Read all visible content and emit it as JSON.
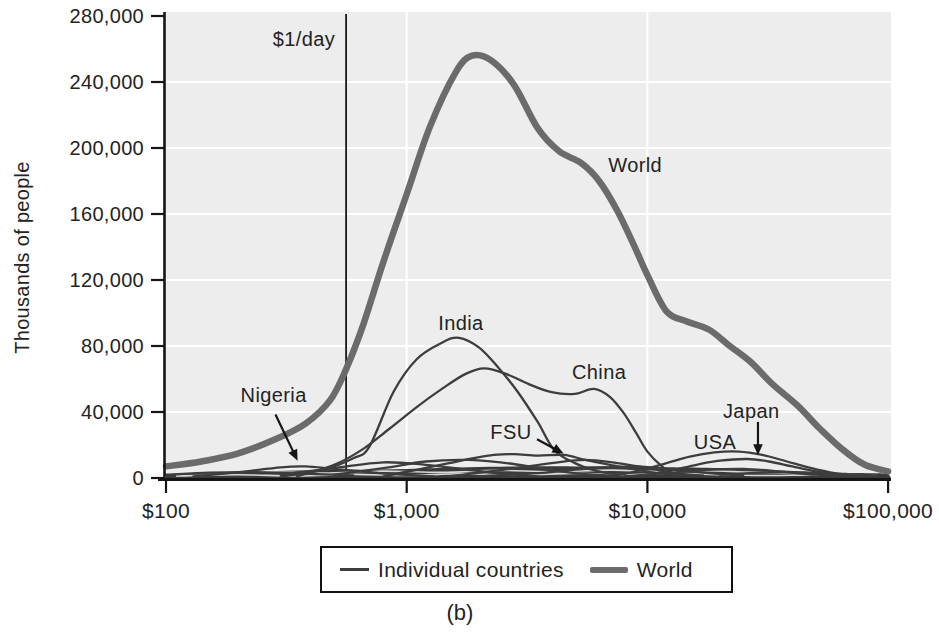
{
  "caption": "(b)",
  "legend": {
    "items": [
      {
        "swatch": "thin",
        "label": "Individual countries"
      },
      {
        "swatch": "thick",
        "label": "World"
      }
    ]
  },
  "chart_data": {
    "type": "line",
    "title": "",
    "xlabel": "",
    "ylabel": "Thousands of people",
    "x_scale": "log",
    "xlim": [
      100,
      100000
    ],
    "ylim": [
      0,
      280000
    ],
    "grid": true,
    "legend_position": "bottom-center",
    "colors": {
      "plot_bg": "#ededed",
      "grid": "#ffffff",
      "world": "#6b6b6b",
      "country": "#3d3d3d",
      "band": "#3a3a3a",
      "streak": "#d9d9d9",
      "axis": "#151515",
      "rule": "#1a1a1a",
      "legend_border": "#111111",
      "text": "#232323"
    },
    "yticks": [
      {
        "v": 0,
        "label": "0"
      },
      {
        "v": 40000,
        "label": "40,000"
      },
      {
        "v": 80000,
        "label": "80,000"
      },
      {
        "v": 120000,
        "label": "120,000"
      },
      {
        "v": 160000,
        "label": "160,000"
      },
      {
        "v": 200000,
        "label": "200,000"
      },
      {
        "v": 240000,
        "label": "240,000"
      },
      {
        "v": 280000,
        "label": "280,000"
      }
    ],
    "xticks": [
      {
        "d": 100,
        "label": "$100"
      },
      {
        "d": 1000,
        "label": "$1,000"
      },
      {
        "d": 10000,
        "label": "$10,000"
      },
      {
        "d": 100000,
        "label": "$100,000"
      }
    ],
    "rule": {
      "dollars": 560,
      "label": "$1/day"
    },
    "baseline_band": {
      "name": "many overlapping low-population countries",
      "points": [
        [
          100,
          2500
        ],
        [
          200,
          3500
        ],
        [
          350,
          4500
        ],
        [
          600,
          5000
        ],
        [
          1000,
          5500
        ],
        [
          1800,
          6500
        ],
        [
          3000,
          7000
        ],
        [
          5000,
          7000
        ],
        [
          8000,
          7000
        ],
        [
          12000,
          6500
        ],
        [
          20000,
          6000
        ],
        [
          30000,
          5000
        ],
        [
          45000,
          4000
        ],
        [
          65000,
          3200
        ],
        [
          100000,
          2800
        ]
      ]
    },
    "band_streaks": [
      {
        "points": [
          [
            110,
            1200
          ],
          [
            200,
            2000
          ],
          [
            350,
            1200
          ],
          [
            600,
            2200
          ],
          [
            1000,
            1500
          ],
          [
            1700,
            2600
          ],
          [
            3000,
            1800
          ],
          [
            5000,
            2800
          ],
          [
            8000,
            2000
          ],
          [
            13000,
            2800
          ],
          [
            20000,
            2000
          ],
          [
            32000,
            1500
          ],
          [
            50000,
            1800
          ],
          [
            80000,
            1200
          ]
        ]
      },
      {
        "points": [
          [
            130,
            3000
          ],
          [
            250,
            3800
          ],
          [
            450,
            3000
          ],
          [
            800,
            4200
          ],
          [
            1400,
            3400
          ],
          [
            2400,
            4600
          ],
          [
            4000,
            3800
          ],
          [
            7000,
            4800
          ],
          [
            11000,
            4000
          ],
          [
            17000,
            4400
          ],
          [
            26000,
            3600
          ],
          [
            40000,
            2800
          ],
          [
            60000,
            2200
          ],
          [
            90000,
            1800
          ]
        ]
      }
    ],
    "series": [
      {
        "name": "World",
        "role": "world",
        "points": [
          [
            100,
            7000
          ],
          [
            140,
            10000
          ],
          [
            200,
            15000
          ],
          [
            280,
            23000
          ],
          [
            380,
            33000
          ],
          [
            480,
            47000
          ],
          [
            560,
            66000
          ],
          [
            660,
            93000
          ],
          [
            800,
            131000
          ],
          [
            1000,
            172000
          ],
          [
            1250,
            213000
          ],
          [
            1600,
            246000
          ],
          [
            1870,
            256000
          ],
          [
            2250,
            253000
          ],
          [
            2800,
            238000
          ],
          [
            3500,
            212000
          ],
          [
            4300,
            198000
          ],
          [
            5300,
            191000
          ],
          [
            6300,
            180000
          ],
          [
            7500,
            162000
          ],
          [
            8800,
            141000
          ],
          [
            10000,
            123000
          ],
          [
            12000,
            101000
          ],
          [
            14500,
            95000
          ],
          [
            18000,
            90000
          ],
          [
            22000,
            80000
          ],
          [
            27000,
            70000
          ],
          [
            33000,
            57000
          ],
          [
            42000,
            44000
          ],
          [
            52000,
            30000
          ],
          [
            65000,
            17000
          ],
          [
            80000,
            8000
          ],
          [
            100000,
            4000
          ]
        ]
      },
      {
        "name": "India",
        "role": "country",
        "points": [
          [
            300,
            1000
          ],
          [
            450,
            5000
          ],
          [
            600,
            12000
          ],
          [
            700,
            19000
          ],
          [
            880,
            52000
          ],
          [
            1100,
            72000
          ],
          [
            1400,
            82000
          ],
          [
            1650,
            85000
          ],
          [
            2000,
            79000
          ],
          [
            2400,
            67000
          ],
          [
            2900,
            52000
          ],
          [
            3500,
            34000
          ],
          [
            4100,
            17000
          ],
          [
            5000,
            9000
          ],
          [
            6100,
            4500
          ],
          [
            7500,
            2000
          ]
        ]
      },
      {
        "name": "China",
        "role": "country",
        "points": [
          [
            350,
            1000
          ],
          [
            500,
            8000
          ],
          [
            650,
            17000
          ],
          [
            850,
            30000
          ],
          [
            1100,
            43000
          ],
          [
            1400,
            54000
          ],
          [
            1750,
            63000
          ],
          [
            2100,
            66500
          ],
          [
            2600,
            63000
          ],
          [
            3200,
            57000
          ],
          [
            4000,
            52000
          ],
          [
            5000,
            51000
          ],
          [
            6000,
            54000
          ],
          [
            7000,
            49000
          ],
          [
            8000,
            39000
          ],
          [
            9000,
            27000
          ],
          [
            10000,
            16000
          ],
          [
            11500,
            7000
          ],
          [
            13000,
            2000
          ]
        ]
      },
      {
        "name": "FSU",
        "role": "country",
        "points": [
          [
            800,
            1000
          ],
          [
            1100,
            5000
          ],
          [
            1500,
            9000
          ],
          [
            1900,
            12000
          ],
          [
            2300,
            14000
          ],
          [
            2800,
            14500
          ],
          [
            3500,
            13500
          ],
          [
            4500,
            14000
          ],
          [
            5500,
            11000
          ],
          [
            7000,
            8000
          ],
          [
            9000,
            5000
          ],
          [
            11000,
            3000
          ],
          [
            14000,
            1500
          ]
        ]
      },
      {
        "name": "USA",
        "role": "country",
        "points": [
          [
            7000,
            1000
          ],
          [
            9000,
            4000
          ],
          [
            12000,
            9000
          ],
          [
            15000,
            13000
          ],
          [
            19000,
            15500
          ],
          [
            24000,
            16000
          ],
          [
            30000,
            14000
          ],
          [
            38000,
            10000
          ],
          [
            48000,
            6000
          ],
          [
            60000,
            3000
          ],
          [
            75000,
            1500
          ],
          [
            90000,
            1000
          ]
        ]
      },
      {
        "name": "Japan",
        "role": "country",
        "points": [
          [
            9000,
            1000
          ],
          [
            12000,
            4000
          ],
          [
            16000,
            8000
          ],
          [
            20000,
            10500
          ],
          [
            26000,
            11500
          ],
          [
            32000,
            10000
          ],
          [
            40000,
            7000
          ],
          [
            50000,
            4000
          ],
          [
            62000,
            2000
          ],
          [
            75000,
            1000
          ]
        ]
      },
      {
        "name": "Nigeria",
        "role": "country",
        "points": [
          [
            130,
            1000
          ],
          [
            200,
            3500
          ],
          [
            300,
            6500
          ],
          [
            380,
            7000
          ],
          [
            500,
            5500
          ],
          [
            700,
            3500
          ],
          [
            950,
            2000
          ],
          [
            1300,
            1000
          ]
        ]
      },
      {
        "name": "unlabeled-1",
        "role": "country",
        "points": [
          [
            1500,
            1000
          ],
          [
            2500,
            5000
          ],
          [
            4000,
            9000
          ],
          [
            5500,
            11000
          ],
          [
            7500,
            9000
          ],
          [
            10000,
            6000
          ],
          [
            13000,
            3000
          ],
          [
            17000,
            1500
          ]
        ]
      },
      {
        "name": "unlabeled-2",
        "role": "country",
        "points": [
          [
            500,
            2000
          ],
          [
            800,
            6000
          ],
          [
            1200,
            10000
          ],
          [
            1800,
            11000
          ],
          [
            2600,
            9000
          ],
          [
            3600,
            6000
          ],
          [
            5000,
            3000
          ],
          [
            7000,
            1500
          ]
        ]
      },
      {
        "name": "unlabeled-3",
        "role": "country",
        "points": [
          [
            300,
            2000
          ],
          [
            500,
            6000
          ],
          [
            800,
            9500
          ],
          [
            1200,
            8000
          ],
          [
            1800,
            5000
          ],
          [
            2600,
            2500
          ],
          [
            3500,
            1000
          ]
        ]
      },
      {
        "name": "unlabeled-4",
        "role": "country",
        "points": [
          [
            2000,
            1000
          ],
          [
            3500,
            3000
          ],
          [
            6000,
            6000
          ],
          [
            9000,
            7000
          ],
          [
            13000,
            5000
          ],
          [
            18000,
            3000
          ],
          [
            25000,
            1500
          ]
        ]
      },
      {
        "name": "unlabeled-5",
        "role": "country",
        "points": [
          [
            8000,
            1000
          ],
          [
            12000,
            3000
          ],
          [
            18000,
            5000
          ],
          [
            25000,
            5500
          ],
          [
            35000,
            4000
          ],
          [
            50000,
            2000
          ],
          [
            70000,
            1000
          ]
        ]
      },
      {
        "name": "unlabeled-6",
        "role": "country",
        "points": [
          [
            20000,
            2000
          ],
          [
            30000,
            3200
          ],
          [
            45000,
            3200
          ],
          [
            65000,
            2200
          ],
          [
            90000,
            1600
          ]
        ]
      },
      {
        "name": "unlabeled-7",
        "role": "country",
        "points": [
          [
            100,
            2000
          ],
          [
            150,
            3200
          ],
          [
            220,
            3600
          ],
          [
            320,
            3000
          ],
          [
            450,
            2200
          ],
          [
            600,
            1600
          ]
        ]
      }
    ],
    "annotations": [
      {
        "id": "dollar-per-day",
        "text": "$1/day",
        "at": [
          374,
          266000
        ]
      },
      {
        "id": "world",
        "text": "World",
        "at": [
          8900,
          190000
        ]
      },
      {
        "id": "india",
        "text": "India",
        "at": [
          1680,
          94000
        ]
      },
      {
        "id": "china",
        "text": "China",
        "at": [
          6300,
          64500
        ]
      },
      {
        "id": "fsu",
        "text": "FSU",
        "at": [
          2710,
          28000
        ],
        "arrow": {
          "from": [
            3480,
            23500
          ],
          "to": [
            4480,
            14800
          ]
        }
      },
      {
        "id": "nigeria",
        "text": "Nigeria",
        "at": [
          280,
          50500
        ],
        "arrow": {
          "from": [
            285,
            38500
          ],
          "to": [
            352,
            10500
          ]
        }
      },
      {
        "id": "usa",
        "text": "USA",
        "at": [
          19100,
          22000
        ]
      },
      {
        "id": "japan",
        "text": "Japan",
        "at": [
          27000,
          40500
        ],
        "arrow": {
          "from": [
            28800,
            34000
          ],
          "to": [
            28800,
            13800
          ]
        }
      }
    ]
  }
}
